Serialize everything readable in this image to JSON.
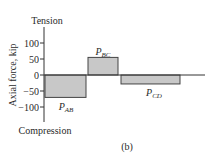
{
  "chart_data": {
    "type": "bar",
    "title": "",
    "caption": "(b)",
    "xlabel": "",
    "ylabel": "Axial force, kip",
    "top_label": "Tension",
    "bottom_label": "Compression",
    "ylim": [
      -120,
      120
    ],
    "yticks": [
      100,
      50,
      0,
      -50,
      -100
    ],
    "ytick_labels": [
      "100",
      "50",
      "0",
      "−50",
      "−100"
    ],
    "categories": [
      "P_AB",
      "P_BC",
      "P_CD"
    ],
    "values": [
      -70,
      55,
      -28
    ],
    "bar_labels": [
      {
        "main": "P",
        "sub": "AB"
      },
      {
        "main": "P",
        "sub": "BC"
      },
      {
        "main": "P",
        "sub": "CD"
      }
    ],
    "bar_spans_px": [
      [
        45,
        86
      ],
      [
        88,
        118
      ],
      [
        121,
        180
      ]
    ],
    "bar_color": "#c8c8c8",
    "edge_color": "#444444",
    "grid": false,
    "legend": null
  }
}
